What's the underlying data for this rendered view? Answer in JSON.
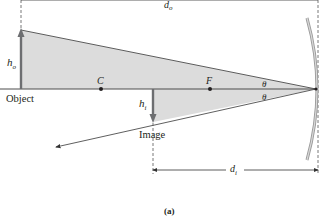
{
  "labels": {
    "d_o": "d",
    "d_o_sub": "o",
    "h_o": "h",
    "h_o_sub": "o",
    "h_i": "h",
    "h_i_sub": "i",
    "d_i": "d",
    "d_i_sub": "i",
    "center": "C",
    "focal": "F",
    "theta_top": "θ",
    "theta_bottom": "θ",
    "object": "Object",
    "image": "Image",
    "caption": "(a)"
  },
  "colors": {
    "ray": "#4d4d4d",
    "shade": "#dcdcdc",
    "arrow": "#6d6e71",
    "mirror": "#b0b0b0"
  }
}
